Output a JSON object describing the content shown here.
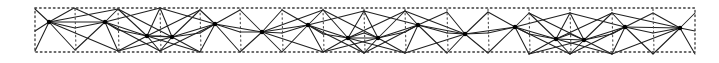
{
  "diagram": {
    "title": "",
    "type": "hand-drawn triangulated strip",
    "colors": {
      "background": "#ffffff",
      "line": "#1f1f1f",
      "dots": "#3a3a3a",
      "hub": "#000000"
    },
    "frame": {
      "x": 35,
      "y": 8,
      "width": 660,
      "height": 44
    },
    "dividers": [
      75,
      118,
      160,
      200,
      240,
      282,
      323,
      364,
      405,
      447,
      488,
      529,
      570,
      612,
      653
    ],
    "top_points": [
      [
        35,
        9
      ],
      [
        74,
        8
      ],
      [
        118,
        9
      ],
      [
        160,
        8
      ],
      [
        200,
        10
      ],
      [
        240,
        10
      ],
      [
        282,
        10
      ],
      [
        323,
        10
      ],
      [
        364,
        11
      ],
      [
        405,
        11
      ],
      [
        447,
        12
      ],
      [
        488,
        12
      ],
      [
        529,
        13
      ],
      [
        570,
        13
      ],
      [
        612,
        13
      ],
      [
        653,
        13
      ],
      [
        695,
        13
      ]
    ],
    "bottom_points": [
      [
        35,
        51
      ],
      [
        75,
        50
      ],
      [
        118,
        51
      ],
      [
        160,
        51
      ],
      [
        200,
        52
      ],
      [
        240,
        52
      ],
      [
        282,
        52
      ],
      [
        323,
        52
      ],
      [
        364,
        53
      ],
      [
        405,
        53
      ],
      [
        447,
        53
      ],
      [
        488,
        53
      ],
      [
        529,
        54
      ],
      [
        570,
        54
      ],
      [
        612,
        54
      ],
      [
        653,
        54
      ],
      [
        695,
        54
      ]
    ],
    "mid_points": [
      [
        35,
        31
      ],
      [
        75,
        28
      ],
      [
        118,
        30
      ],
      [
        160,
        36
      ],
      [
        200,
        33
      ],
      [
        240,
        32
      ],
      [
        282,
        33
      ],
      [
        323,
        34
      ],
      [
        364,
        33
      ],
      [
        405,
        32
      ],
      [
        447,
        33
      ],
      [
        488,
        33
      ],
      [
        529,
        34
      ],
      [
        570,
        34
      ],
      [
        612,
        34
      ],
      [
        653,
        33
      ],
      [
        695,
        31
      ]
    ],
    "hubs": [
      [
        49,
        22
      ],
      [
        105,
        22
      ],
      [
        147,
        36
      ],
      [
        172,
        37
      ],
      [
        215,
        24
      ],
      [
        262,
        32
      ],
      [
        308,
        25
      ],
      [
        348,
        38
      ],
      [
        378,
        38
      ],
      [
        418,
        25
      ],
      [
        465,
        34
      ],
      [
        515,
        27
      ],
      [
        556,
        39
      ],
      [
        584,
        40
      ],
      [
        625,
        27
      ],
      [
        680,
        28
      ]
    ]
  }
}
